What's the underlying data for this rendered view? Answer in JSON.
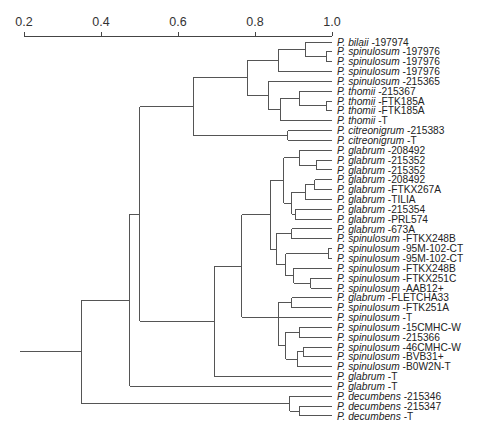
{
  "chart_data": {
    "type": "dendrogram",
    "title": "",
    "xlabel": "",
    "axis": {
      "ticks": [
        0.2,
        0.4,
        0.6,
        0.8,
        1.0
      ],
      "tick_labels": [
        "0.2",
        "0.4",
        "0.6",
        "0.8",
        "1.0"
      ],
      "range": [
        0.2,
        1.0
      ]
    },
    "leaves": [
      {
        "genus": "P.",
        "species": "bilaii",
        "strain": "-197974"
      },
      {
        "genus": "P.",
        "species": "spinulosum",
        "strain": "-197976"
      },
      {
        "genus": "P.",
        "species": "spinulosum",
        "strain": "-197976"
      },
      {
        "genus": "P.",
        "species": "spinulosum",
        "strain": "-197976"
      },
      {
        "genus": "P.",
        "species": "spinulosum",
        "strain": "-215365"
      },
      {
        "genus": "P.",
        "species": "thomii",
        "strain": "-215367"
      },
      {
        "genus": "P.",
        "species": "thomii",
        "strain": "-FTK185A"
      },
      {
        "genus": "P.",
        "species": "thomii",
        "strain": "-FTK185A"
      },
      {
        "genus": "P.",
        "species": "thomii",
        "strain": "-T"
      },
      {
        "genus": "P.",
        "species": "citreonigrum",
        "strain": "-215383"
      },
      {
        "genus": "P.",
        "species": "citreonigrum",
        "strain": "-T"
      },
      {
        "genus": "P.",
        "species": "glabrum",
        "strain": "-208492"
      },
      {
        "genus": "P.",
        "species": "glabrum",
        "strain": "-215352"
      },
      {
        "genus": "P.",
        "species": "glabrum",
        "strain": "-215352"
      },
      {
        "genus": "P.",
        "species": "glabrum",
        "strain": "-208492"
      },
      {
        "genus": "P.",
        "species": "glabrum",
        "strain": "-FTKX267A"
      },
      {
        "genus": "P.",
        "species": "glabrum",
        "strain": "-TILIA"
      },
      {
        "genus": "P.",
        "species": "glabrum",
        "strain": "-215354"
      },
      {
        "genus": "P.",
        "species": "glabrum",
        "strain": "-PRL574"
      },
      {
        "genus": "P.",
        "species": "glabrum",
        "strain": "-673A"
      },
      {
        "genus": "P.",
        "species": "spinulosum",
        "strain": "-FTKX248B"
      },
      {
        "genus": "P.",
        "species": "spinulosum",
        "strain": "-95M-102-CT"
      },
      {
        "genus": "P.",
        "species": "spinulosum",
        "strain": "-95M-102-CT"
      },
      {
        "genus": "P.",
        "species": "spinulosum",
        "strain": "-FTKX248B"
      },
      {
        "genus": "P.",
        "species": "spinulosum",
        "strain": "-FTKX251C"
      },
      {
        "genus": "P.",
        "species": "spinulosum",
        "strain": "-AAB12+"
      },
      {
        "genus": "P.",
        "species": "glabrum",
        "strain": "-FLETCHA33"
      },
      {
        "genus": "P.",
        "species": "spinulosum",
        "strain": "-FTK251A"
      },
      {
        "genus": "P.",
        "species": "spinulosum",
        "strain": "-T"
      },
      {
        "genus": "P.",
        "species": "spinulosum",
        "strain": "-15CMHC-W"
      },
      {
        "genus": "P.",
        "species": "spinulosum",
        "strain": "-215366"
      },
      {
        "genus": "P.",
        "species": "spinulosum",
        "strain": "-46CMHC-W"
      },
      {
        "genus": "P.",
        "species": "spinulosum",
        "strain": "-BVB31+"
      },
      {
        "genus": "P.",
        "species": "spinulosum",
        "strain": "-B0W2N-T"
      },
      {
        "genus": "P.",
        "species": "glabrum",
        "strain": "-T"
      },
      {
        "genus": "P.",
        "species": "glabrum",
        "strain": "-T"
      },
      {
        "genus": "P.",
        "species": "decumbens",
        "strain": "-215346"
      },
      {
        "genus": "P.",
        "species": "decumbens",
        "strain": "-215347"
      },
      {
        "genus": "P.",
        "species": "decumbens",
        "strain": "-T"
      }
    ],
    "tree": {
      "h": 0.35,
      "c": [
        {
          "h": 0.475,
          "c": [
            {
              "h": 0.5,
              "c": [
                {
                  "h": 0.64,
                  "c": [
                    {
                      "h": 0.78,
                      "c": [
                        {
                          "h": 0.86,
                          "c": [
                            {
                              "h": 0.93,
                              "c": [
                                0,
                                {
                                  "h": 0.985,
                                  "c": [
                                    1,
                                    2
                                  ]
                                }
                              ]
                            },
                            3
                          ]
                        },
                        {
                          "h": 0.835,
                          "c": [
                            4,
                            {
                              "h": 0.865,
                              "c": [
                                {
                                  "h": 0.915,
                                  "c": [
                                    5,
                                    {
                                      "h": 0.985,
                                      "c": [
                                        6,
                                        7
                                      ]
                                    }
                                  ]
                                },
                                8
                              ]
                            }
                          ]
                        }
                      ]
                    },
                    {
                      "h": 0.885,
                      "c": [
                        9,
                        10
                      ]
                    }
                  ]
                },
                {
                  "h": 0.695,
                  "c": [
                    {
                      "h": 0.765,
                      "c": [
                        {
                          "h": 0.84,
                          "c": [
                            {
                              "h": 0.875,
                              "c": [
                                {
                                  "h": 0.915,
                                  "c": [
                                    11,
                                    {
                                      "h": 0.96,
                                      "c": [
                                        12,
                                        13
                                      ]
                                    }
                                  ]
                                },
                                {
                                  "h": 0.895,
                                  "c": [
                                    {
                                      "h": 0.93,
                                      "c": [
                                        {
                                          "h": 0.955,
                                          "c": [
                                            14,
                                            15
                                          ]
                                        },
                                        16
                                      ]
                                    },
                                    {
                                      "h": 0.905,
                                      "c": [
                                        17,
                                        18
                                      ]
                                    }
                                  ]
                                }
                              ]
                            },
                            {
                              "h": 0.855,
                              "c": [
                                {
                                  "h": 0.895,
                                  "c": [
                                    19,
                                    20
                                  ]
                                },
                                {
                                  "h": 0.88,
                                  "c": [
                                    {
                                      "h": 0.99,
                                      "c": [
                                        21,
                                        22
                                      ]
                                    },
                                    {
                                      "h": 0.9,
                                      "c": [
                                        23,
                                        {
                                          "h": 0.945,
                                          "c": [
                                            24,
                                            25
                                          ]
                                        }
                                      ]
                                    }
                                  ]
                                }
                              ]
                            }
                          ]
                        },
                        {
                          "h": 0.86,
                          "c": [
                            {
                              "h": 0.895,
                              "c": [
                                26,
                                27
                              ]
                            },
                            {
                              "h": 0.86,
                              "c": [
                                28,
                                {
                                  "h": 0.88,
                                  "c": [
                                    {
                                      "h": 0.915,
                                      "c": [
                                        29,
                                        30
                                      ]
                                    },
                                    {
                                      "h": 0.91,
                                      "c": [
                                        {
                                          "h": 0.925,
                                          "c": [
                                            31,
                                            32
                                          ]
                                        },
                                        33
                                      ]
                                    }
                                  ]
                                }
                              ]
                            }
                          ]
                        }
                      ]
                    },
                    34
                  ]
                }
              ]
            },
            35
          ]
        },
        {
          "h": 0.89,
          "c": [
            36,
            {
              "h": 0.915,
              "c": [
                37,
                38
              ]
            }
          ]
        }
      ]
    }
  },
  "layout": {
    "axis_y": 36,
    "x_at_0_2": 24,
    "x_at_1_0": 332,
    "first_row_y": 42,
    "row_step": 9.84,
    "label_x": 337,
    "root_stub_x": 20
  }
}
